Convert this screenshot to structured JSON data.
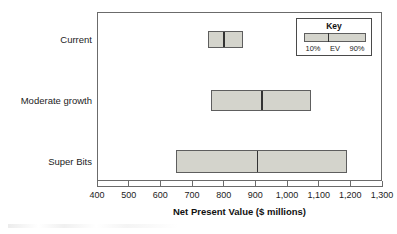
{
  "chart_data": {
    "type": "bar",
    "subtype": "floating-range-bar",
    "title": "",
    "xlabel": "Net Present Value ($ millions)",
    "ylabel": "",
    "xlim": [
      400,
      1300
    ],
    "xticks": [
      400,
      500,
      600,
      700,
      800,
      900,
      1000,
      1100,
      1200,
      1300
    ],
    "xtick_labels": [
      "400",
      "500",
      "600",
      "700",
      "800",
      "900",
      "1,000",
      "1,100",
      "1,200",
      "1,300"
    ],
    "grid": false,
    "categories": [
      "Current",
      "Moderate growth",
      "Super Bits"
    ],
    "series": [
      {
        "name": "10%",
        "values": [
          750,
          760,
          650
        ]
      },
      {
        "name": "EV",
        "values": [
          800,
          920,
          905
        ]
      },
      {
        "name": "90%",
        "values": [
          860,
          1075,
          1190
        ]
      }
    ],
    "bars": [
      {
        "category": "Current",
        "low": 750,
        "ev": 800,
        "high": 860
      },
      {
        "category": "Moderate growth",
        "low": 760,
        "ev": 920,
        "high": 1075
      },
      {
        "category": "Super Bits",
        "low": 650,
        "ev": 905,
        "high": 1190
      }
    ],
    "legend": {
      "position": "top-right",
      "title": "Key",
      "entries": [
        "10%",
        "EV",
        "90%"
      ]
    },
    "colors": {
      "bar_fill": "#d4d4cc",
      "bar_border": "#5e5e5e",
      "ev_marker": "#333333",
      "axis": "#6b6b6b",
      "text": "#1c1c1c",
      "background": "#ffffff"
    }
  },
  "axis": {
    "title": "Net Present Value ($ millions)"
  },
  "key": {
    "title": "Key",
    "low_label": "10%",
    "ev_label": "EV",
    "high_label": "90%"
  },
  "categories": {
    "current": "Current",
    "moderate_growth": "Moderate growth",
    "super_bits": "Super Bits"
  }
}
